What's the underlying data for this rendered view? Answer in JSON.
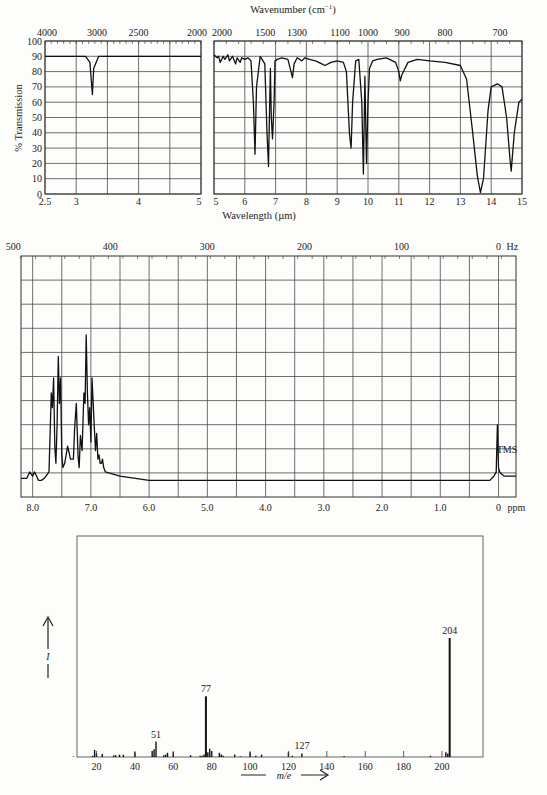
{
  "colors": {
    "background": "#fdfdfb",
    "ink": "#1a1a1a",
    "grid": "#4a4a4a"
  },
  "chart_data": [
    {
      "type": "line",
      "title": "IR spectrum",
      "ylabel": "% Transmission",
      "xlabel": "Wavelength (µm)",
      "x2label": "Wavenumber (cm⁻¹)",
      "ylim": [
        0,
        100
      ],
      "yticks": [
        0,
        10,
        20,
        30,
        40,
        50,
        60,
        70,
        80,
        90,
        100
      ],
      "grid": true,
      "panels": [
        {
          "name": "left",
          "xlim": [
            2.5,
            5
          ],
          "xticks": [
            "2.5",
            "3",
            "4",
            "5"
          ],
          "x2ticks": [
            "4000",
            "3000",
            "2500",
            "2000"
          ],
          "x": [
            2.5,
            3.15,
            3.22,
            3.24,
            3.26,
            3.28,
            3.3,
            3.36,
            5.0
          ],
          "y": [
            90,
            90,
            86,
            75,
            65,
            82,
            84,
            90,
            90
          ]
        },
        {
          "name": "right",
          "xlim": [
            5,
            15
          ],
          "xticks": [
            "5",
            "6",
            "7",
            "8",
            "9",
            "10",
            "11",
            "12",
            "13",
            "14",
            "15"
          ],
          "x2ticks": [
            "2000",
            "1500",
            "1300",
            "1100",
            "1000",
            "900",
            "800",
            "700"
          ],
          "x": [
            5.0,
            5.1,
            5.15,
            5.2,
            5.3,
            5.35,
            5.45,
            5.5,
            5.6,
            5.7,
            5.75,
            5.85,
            5.9,
            6.0,
            6.1,
            6.2,
            6.28,
            6.33,
            6.38,
            6.5,
            6.65,
            6.72,
            6.77,
            6.8,
            6.83,
            6.86,
            6.9,
            6.95,
            6.98,
            7.05,
            7.2,
            7.4,
            7.5,
            7.55,
            7.6,
            7.7,
            7.85,
            7.95,
            8.1,
            8.3,
            8.5,
            8.6,
            8.8,
            9.0,
            9.2,
            9.3,
            9.4,
            9.45,
            9.5,
            9.6,
            9.7,
            9.8,
            9.85,
            9.9,
            9.95,
            10.0,
            10.05,
            10.15,
            10.3,
            10.6,
            10.9,
            11.0,
            11.05,
            11.1,
            11.3,
            11.6,
            12.0,
            12.5,
            13.0,
            13.2,
            13.4,
            13.55,
            13.65,
            13.75,
            13.9,
            14.0,
            14.2,
            14.35,
            14.5,
            14.6,
            14.65,
            14.75,
            14.9,
            15.0
          ],
          "y": [
            91,
            89,
            90,
            86,
            90,
            88,
            91,
            87,
            90,
            85,
            89,
            86,
            89,
            88,
            89,
            87,
            60,
            26,
            70,
            90,
            85,
            40,
            18,
            50,
            82,
            50,
            36,
            60,
            87,
            88,
            89,
            88,
            80,
            76,
            85,
            89,
            87,
            89,
            88,
            87,
            85,
            84,
            86,
            87,
            86,
            80,
            39,
            30,
            60,
            87,
            88,
            60,
            13,
            77,
            20,
            60,
            82,
            87,
            88,
            89,
            86,
            80,
            74,
            78,
            86,
            88,
            87,
            86,
            84,
            75,
            40,
            12,
            1,
            10,
            55,
            70,
            72,
            70,
            50,
            25,
            15,
            40,
            60,
            62
          ]
        }
      ]
    },
    {
      "type": "line",
      "title": "1H NMR spectrum",
      "xlabel": "ppm",
      "x2label": "Hz",
      "xlim": [
        8.2,
        -0.3
      ],
      "xticks": [
        "8.0",
        "7.0",
        "6.0",
        "5.0",
        "4.0",
        "3.0",
        "2.0",
        "1.0",
        "0"
      ],
      "x2ticks": [
        "500",
        "400",
        "300",
        "200",
        "100",
        "0"
      ],
      "x2unit": "Hz",
      "xunit": "ppm",
      "grid": true,
      "annotations": [
        {
          "text": "TMS",
          "x": 0
        }
      ],
      "x": [
        8.2,
        8.1,
        8.05,
        8.0,
        7.97,
        7.93,
        7.9,
        7.85,
        7.8,
        7.72,
        7.68,
        7.66,
        7.64,
        7.62,
        7.6,
        7.58,
        7.56,
        7.54,
        7.52,
        7.5,
        7.48,
        7.45,
        7.4,
        7.35,
        7.3,
        7.28,
        7.25,
        7.22,
        7.2,
        7.18,
        7.15,
        7.12,
        7.1,
        7.08,
        7.06,
        7.04,
        7.02,
        7.0,
        6.98,
        6.96,
        6.94,
        6.92,
        6.9,
        6.88,
        6.86,
        6.84,
        6.82,
        6.8,
        6.78,
        6.75,
        6.5,
        6.0,
        5.0,
        4.0,
        3.0,
        2.0,
        1.0,
        0.15,
        0.08,
        0.04,
        0.02,
        0.0,
        -0.02,
        -0.05,
        -0.1,
        -0.3
      ],
      "y": [
        5,
        5,
        8,
        6,
        8,
        6,
        4,
        4,
        5,
        8,
        45,
        38,
        52,
        20,
        12,
        30,
        62,
        40,
        52,
        16,
        10,
        12,
        20,
        14,
        14,
        28,
        40,
        15,
        10,
        25,
        18,
        45,
        40,
        72,
        45,
        30,
        38,
        22,
        52,
        40,
        28,
        18,
        26,
        14,
        16,
        12,
        12,
        14,
        10,
        8,
        6,
        4,
        4,
        4,
        4,
        4,
        4,
        4,
        6,
        8,
        30,
        10,
        8,
        7,
        6,
        6
      ]
    },
    {
      "type": "bar",
      "title": "Mass spectrum",
      "xlabel": "m/e",
      "ylabel": "I",
      "xlim": [
        0,
        215
      ],
      "xticks": [
        "20",
        "40",
        "60",
        "80",
        "100",
        "120",
        "140",
        "160",
        "180",
        "200"
      ],
      "annotations": [
        {
          "text": "51",
          "x": 51
        },
        {
          "text": "77",
          "x": 77
        },
        {
          "text": "127",
          "x": 127
        },
        {
          "text": "204",
          "x": 204
        }
      ],
      "x": [
        8,
        18,
        19,
        20,
        23,
        29,
        30,
        32,
        34,
        40,
        49,
        50,
        51,
        55,
        56,
        57,
        60,
        69,
        74,
        75,
        76,
        77,
        78,
        79,
        80,
        84,
        85,
        86,
        92,
        95,
        100,
        103,
        106,
        120,
        122,
        127,
        149,
        194,
        202,
        203,
        204
      ],
      "values": [
        0.5,
        1,
        6,
        3,
        2.5,
        1.5,
        1.5,
        2,
        2,
        4,
        5,
        6.5,
        13,
        1.5,
        2,
        3.5,
        4,
        1.5,
        1,
        1,
        2,
        51,
        4,
        7,
        5,
        3.5,
        2,
        1,
        2,
        0.5,
        4,
        1,
        2,
        4,
        1,
        3,
        0.8,
        1,
        4,
        3,
        100
      ]
    }
  ],
  "ir": {
    "wavenumber_label": "Wavenumber (cm",
    "wavenumber_sup": "−1",
    "wavenumber_close": ")",
    "ylabel": "% Transmission",
    "xlabel": "Wavelength (µm)"
  },
  "nmr": {
    "tms_label": "TMS",
    "ppm_unit": "ppm",
    "hz_unit": "Hz"
  },
  "ms": {
    "xlabel": "m/e",
    "ylabel": "I"
  }
}
